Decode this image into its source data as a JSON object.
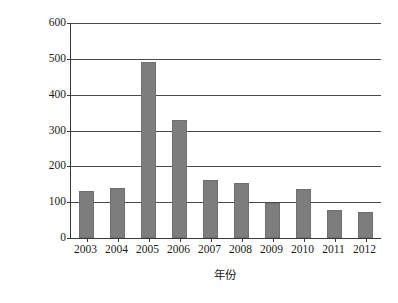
{
  "chart_data": {
    "type": "bar",
    "title": "",
    "subtitle": "",
    "xlabel": "年份",
    "ylabel": "海洋灾害死亡人数 / 人",
    "categories": [
      "2003",
      "2004",
      "2005",
      "2006",
      "2007",
      "2008",
      "2009",
      "2010",
      "2011",
      "2012"
    ],
    "values": [
      130,
      140,
      490,
      330,
      163,
      153,
      97,
      138,
      79,
      73
    ],
    "series": [
      {
        "name": "海洋灾害死亡人数",
        "values": [
          130,
          140,
          490,
          330,
          163,
          153,
          97,
          138,
          79,
          73
        ]
      }
    ],
    "ylim": [
      0,
      600
    ],
    "ytick_values": [
      0,
      100,
      200,
      300,
      400,
      500,
      600
    ],
    "ytick_labels": [
      "0",
      "100",
      "200",
      "300",
      "400",
      "500",
      "600"
    ],
    "xtick_labels": [
      "2003",
      "2004",
      "2005",
      "2006",
      "2007",
      "2008",
      "2009",
      "2010",
      "2011",
      "2012"
    ],
    "grid": "horizontal",
    "legend": "none",
    "bar_color": "#7d7d7d",
    "axis_color": "#3a3a3a",
    "gridline_color": "#4a4a4a",
    "background_color": "#ffffff",
    "annotations": []
  }
}
